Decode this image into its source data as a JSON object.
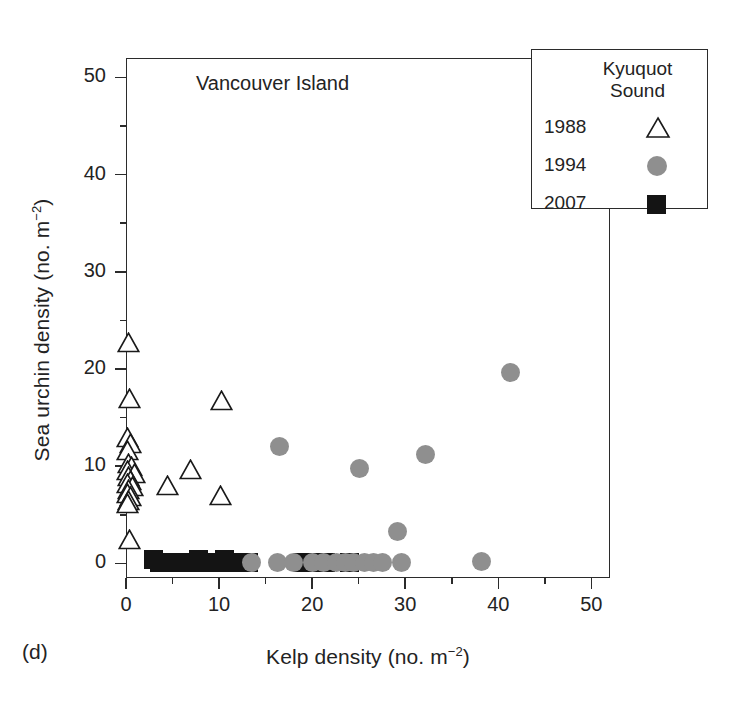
{
  "figure": {
    "panel_letter": "(d)",
    "region_label": "Vancouver Island"
  },
  "legend": {
    "title_line1": "Kyuquot",
    "title_line2": "Sound",
    "entries": [
      {
        "label": "1988",
        "symbol": "open-triangle",
        "color": "#ffffff"
      },
      {
        "label": "1994",
        "symbol": "filled-circle",
        "color": "#8f8f8f"
      },
      {
        "label": "2007",
        "symbol": "filled-square",
        "color": "#141414"
      }
    ]
  },
  "chart_data": {
    "type": "scatter",
    "title": "Vancouver Island",
    "panel": "(d)",
    "xlabel": "Kelp density (no. m⁻²)",
    "ylabel": "Sea urchin density (no. m⁻²)",
    "xlim": [
      0,
      52
    ],
    "ylim": [
      -1.5,
      52
    ],
    "xticks": [
      0,
      10,
      20,
      30,
      40,
      50
    ],
    "xticklabels": [
      "0",
      "10",
      "20",
      "30",
      "40",
      "50"
    ],
    "xminorticks": [
      5,
      15,
      25,
      35,
      45
    ],
    "yticks": [
      0,
      10,
      20,
      30,
      40,
      50
    ],
    "yticklabels": [
      "0",
      "10",
      "20",
      "30",
      "40",
      "50"
    ],
    "yminorticks": [
      5,
      15,
      25,
      35,
      45
    ],
    "grid": false,
    "legend_position": "top-right",
    "series": [
      {
        "name": "1988",
        "marker": "open-triangle",
        "fill": "#ffffff",
        "edge": "#1a1a1a",
        "points": [
          [
            0.3,
            22.7
          ],
          [
            0.4,
            17.0
          ],
          [
            0.2,
            13.0
          ],
          [
            0.5,
            12.3
          ],
          [
            0.2,
            11.6
          ],
          [
            0.3,
            10.3
          ],
          [
            0.6,
            10.0
          ],
          [
            0.2,
            9.6
          ],
          [
            0.9,
            9.3
          ],
          [
            0.3,
            8.9
          ],
          [
            0.5,
            8.5
          ],
          [
            0.2,
            8.2
          ],
          [
            0.7,
            7.9
          ],
          [
            0.3,
            7.6
          ],
          [
            0.2,
            7.2
          ],
          [
            0.5,
            6.9
          ],
          [
            0.3,
            6.5
          ],
          [
            0.2,
            6.2
          ],
          [
            0.4,
            2.5
          ],
          [
            4.5,
            8.0
          ],
          [
            6.9,
            9.7
          ],
          [
            10.3,
            16.8
          ],
          [
            10.2,
            7.0
          ]
        ]
      },
      {
        "name": "1994",
        "marker": "filled-circle",
        "fill": "#8f8f8f",
        "edge": "#8f8f8f",
        "points": [
          [
            16.5,
            12.0
          ],
          [
            25.1,
            9.8
          ],
          [
            29.2,
            3.3
          ],
          [
            32.2,
            11.2
          ],
          [
            41.3,
            19.6
          ],
          [
            13.5,
            0.1
          ],
          [
            16.3,
            0.1
          ],
          [
            18.0,
            0.1
          ],
          [
            20.0,
            0.1
          ],
          [
            21.2,
            0.1
          ],
          [
            22.6,
            0.1
          ],
          [
            23.6,
            0.1
          ],
          [
            24.4,
            0.1
          ],
          [
            25.6,
            0.1
          ],
          [
            26.6,
            0.1
          ],
          [
            27.6,
            0.1
          ],
          [
            29.6,
            0.1
          ],
          [
            38.2,
            0.2
          ]
        ]
      },
      {
        "name": "2007",
        "marker": "filled-square",
        "fill": "#141414",
        "edge": "#141414",
        "points": [
          [
            3.0,
            0.4
          ],
          [
            3.6,
            0.1
          ],
          [
            4.2,
            0.1
          ],
          [
            4.8,
            0.1
          ],
          [
            5.4,
            0.1
          ],
          [
            6.0,
            0.1
          ],
          [
            6.6,
            0.1
          ],
          [
            7.2,
            0.1
          ],
          [
            7.8,
            0.45
          ],
          [
            8.4,
            0.1
          ],
          [
            9.0,
            0.1
          ],
          [
            9.6,
            0.1
          ],
          [
            10.6,
            0.4
          ],
          [
            11.2,
            0.1
          ],
          [
            11.8,
            0.1
          ],
          [
            13.2,
            0.1
          ],
          [
            19.0,
            0.1
          ],
          [
            19.8,
            0.1
          ],
          [
            20.6,
            0.1
          ],
          [
            21.4,
            0.1
          ],
          [
            24.0,
            0.1
          ]
        ]
      }
    ]
  }
}
